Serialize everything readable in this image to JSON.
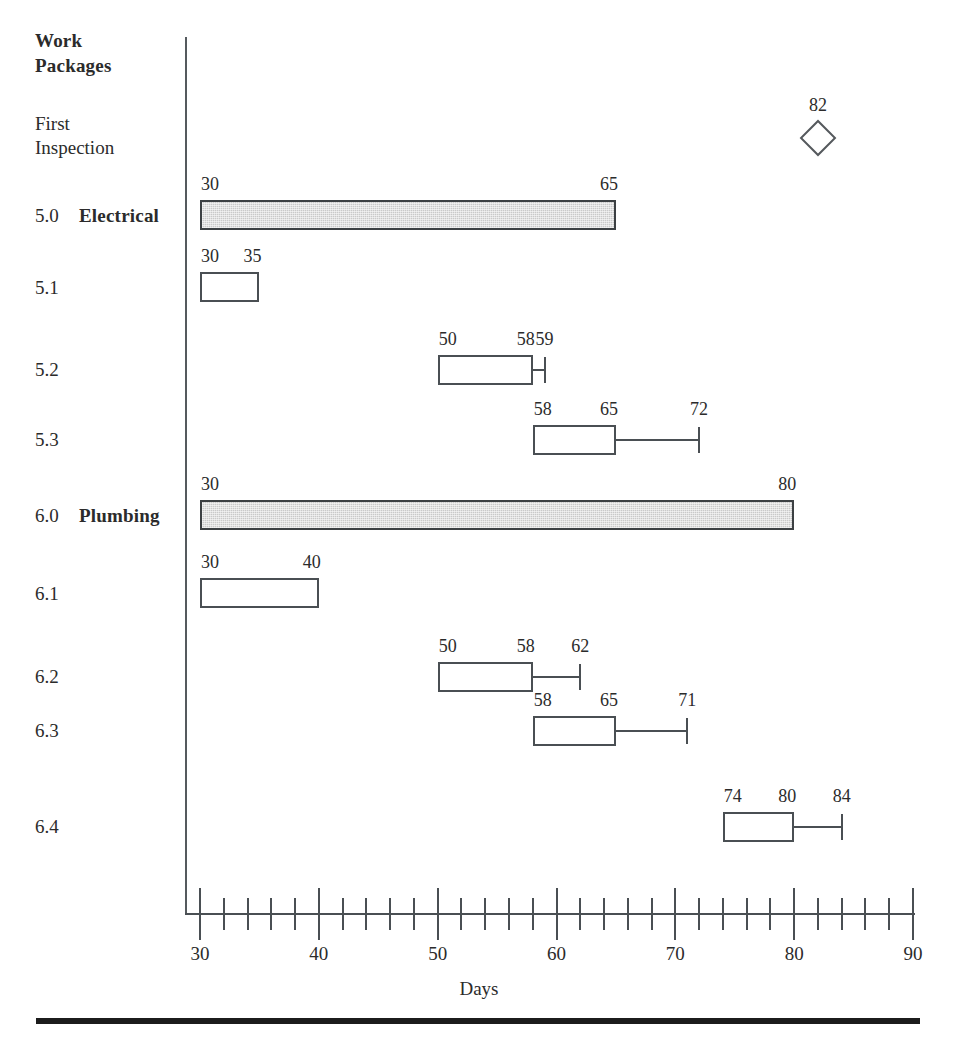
{
  "header": {
    "line1": "Work",
    "line2": "Packages"
  },
  "axis": {
    "title": "Days",
    "min": 30,
    "max": 90,
    "major_step": 10,
    "minor_step": 2,
    "tick_labels": [
      "30",
      "40",
      "50",
      "60",
      "70",
      "80",
      "90"
    ]
  },
  "colors": {
    "summary_fill": "#c9c9c9",
    "outline": "#4a4f53",
    "text": "#2b2b2b",
    "rule": "#1c1c1c"
  },
  "rows": [
    {
      "id": "first-inspection",
      "wbs": "",
      "name": "First Inspection",
      "name_line1": "First",
      "name_line2": "Inspection",
      "type": "milestone",
      "bold": false,
      "milestone_at": 82,
      "labels": [
        "82"
      ]
    },
    {
      "id": "5-0-electrical",
      "wbs": "5.0",
      "name": "Electrical",
      "type": "summary",
      "bold": true,
      "start": 30,
      "end": 65,
      "whisker_end": null,
      "labels": [
        "30",
        "65"
      ]
    },
    {
      "id": "5-1",
      "wbs": "5.1",
      "name": "",
      "type": "task",
      "bold": false,
      "start": 30,
      "end": 35,
      "whisker_end": null,
      "labels": [
        "30",
        "35"
      ]
    },
    {
      "id": "5-2",
      "wbs": "5.2",
      "name": "",
      "type": "task",
      "bold": false,
      "start": 50,
      "end": 58,
      "whisker_end": 59,
      "labels": [
        "50",
        "58",
        "59"
      ]
    },
    {
      "id": "5-3",
      "wbs": "5.3",
      "name": "",
      "type": "task",
      "bold": false,
      "start": 58,
      "end": 65,
      "whisker_end": 72,
      "labels": [
        "58",
        "65",
        "72"
      ]
    },
    {
      "id": "6-0-plumbing",
      "wbs": "6.0",
      "name": "Plumbing",
      "type": "summary",
      "bold": true,
      "start": 30,
      "end": 80,
      "whisker_end": null,
      "labels": [
        "30",
        "80"
      ]
    },
    {
      "id": "6-1",
      "wbs": "6.1",
      "name": "",
      "type": "task",
      "bold": false,
      "start": 30,
      "end": 40,
      "whisker_end": null,
      "labels": [
        "30",
        "40"
      ]
    },
    {
      "id": "6-2",
      "wbs": "6.2",
      "name": "",
      "type": "task",
      "bold": false,
      "start": 50,
      "end": 58,
      "whisker_end": 62,
      "labels": [
        "50",
        "58",
        "62"
      ]
    },
    {
      "id": "6-3",
      "wbs": "6.3",
      "name": "",
      "type": "task",
      "bold": false,
      "start": 58,
      "end": 65,
      "whisker_end": 71,
      "labels": [
        "58",
        "65",
        "71"
      ]
    },
    {
      "id": "6-4",
      "wbs": "6.4",
      "name": "",
      "type": "task",
      "bold": false,
      "start": 74,
      "end": 80,
      "whisker_end": 84,
      "labels": [
        "74",
        "80",
        "84"
      ]
    }
  ],
  "chart_data": {
    "type": "bar",
    "title": "Work Packages",
    "xlabel": "Days",
    "ylabel": "Work Packages",
    "xlim": [
      30,
      90
    ],
    "grid": false,
    "legend": null,
    "orientation": "horizontal",
    "categories": [
      "First Inspection",
      "5.0 Electrical",
      "5.1",
      "5.2",
      "5.3",
      "6.0 Plumbing",
      "6.1",
      "6.2",
      "6.3",
      "6.4"
    ],
    "series": [
      {
        "name": "Work package duration (start / finish / latest finish)",
        "values": [
          {
            "category": "First Inspection",
            "kind": "milestone",
            "start": 82,
            "end": 82,
            "whisker_end": null
          },
          {
            "category": "5.0 Electrical",
            "kind": "summary",
            "start": 30,
            "end": 65,
            "whisker_end": null
          },
          {
            "category": "5.1",
            "kind": "task",
            "start": 30,
            "end": 35,
            "whisker_end": null
          },
          {
            "category": "5.2",
            "kind": "task",
            "start": 50,
            "end": 58,
            "whisker_end": 59
          },
          {
            "category": "5.3",
            "kind": "task",
            "start": 58,
            "end": 65,
            "whisker_end": 72
          },
          {
            "category": "6.0 Plumbing",
            "kind": "summary",
            "start": 30,
            "end": 80,
            "whisker_end": null
          },
          {
            "category": "6.1",
            "kind": "task",
            "start": 30,
            "end": 40,
            "whisker_end": null
          },
          {
            "category": "6.2",
            "kind": "task",
            "start": 50,
            "end": 58,
            "whisker_end": 62
          },
          {
            "category": "6.3",
            "kind": "task",
            "start": 58,
            "end": 65,
            "whisker_end": 71
          },
          {
            "category": "6.4",
            "kind": "task",
            "start": 74,
            "end": 80,
            "whisker_end": 84
          }
        ]
      }
    ],
    "xticks": [
      30,
      40,
      50,
      60,
      70,
      80,
      90
    ],
    "xminor_ticks": [
      32,
      34,
      36,
      38,
      42,
      44,
      46,
      48,
      52,
      54,
      56,
      58,
      62,
      64,
      66,
      68,
      72,
      74,
      76,
      78,
      82,
      84,
      86,
      88
    ]
  }
}
